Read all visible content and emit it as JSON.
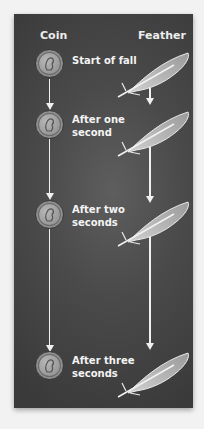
{
  "headers": {
    "coin": "Coin",
    "feather": "Feather"
  },
  "steps": [
    {
      "label_line1": "Start of fall",
      "label_line2": ""
    },
    {
      "label_line1": "After one",
      "label_line2": "second"
    },
    {
      "label_line1": "After two",
      "label_line2": "seconds"
    },
    {
      "label_line1": "After three",
      "label_line2": "seconds"
    }
  ],
  "icons": {
    "coin": "coin-icon",
    "feather": "feather-icon",
    "arrow": "arrow-down-icon"
  },
  "colors": {
    "panel": "#4a4a4a",
    "text": "#f4f4f4",
    "arrow": "#f0f0f0",
    "page": "#f2f2f2"
  }
}
